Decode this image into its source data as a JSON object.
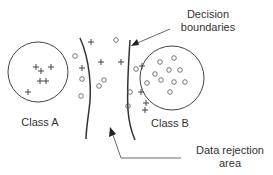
{
  "diagram": {
    "labels": {
      "class_a": "Class A",
      "class_b": "Class B",
      "decision_boundaries_line1": "Decision",
      "decision_boundaries_line2": "boundaries",
      "rejection_line1": "Data rejection",
      "rejection_line2": "area"
    },
    "colors": {
      "stroke": "#333333",
      "marker": "#444444",
      "background": "#ffffff"
    },
    "class_a_circle": {
      "cx": 38,
      "cy": 72,
      "r": 30
    },
    "class_b_circle": {
      "cx": 172,
      "cy": 78,
      "r": 32
    },
    "markers": {
      "plus": [
        [
          36,
          67
        ],
        [
          41,
          71
        ],
        [
          51,
          67
        ],
        [
          40,
          81
        ],
        [
          46,
          81
        ],
        [
          28,
          92
        ],
        [
          91,
          42
        ],
        [
          82,
          68
        ],
        [
          101,
          62
        ],
        [
          121,
          62
        ],
        [
          142,
          66
        ],
        [
          141,
          92
        ],
        [
          146,
          103
        ],
        [
          145,
          110
        ]
      ],
      "circle": [
        [
          75,
          56
        ],
        [
          116,
          40
        ],
        [
          82,
          79
        ],
        [
          81,
          96
        ],
        [
          99,
          86
        ],
        [
          104,
          80
        ],
        [
          136,
          69
        ],
        [
          130,
          92
        ],
        [
          128,
          106
        ],
        [
          160,
          62
        ],
        [
          174,
          58
        ],
        [
          155,
          74
        ],
        [
          169,
          70
        ],
        [
          180,
          70
        ],
        [
          161,
          80
        ],
        [
          174,
          82
        ],
        [
          147,
          83
        ],
        [
          185,
          82
        ],
        [
          170,
          92
        ]
      ]
    }
  }
}
